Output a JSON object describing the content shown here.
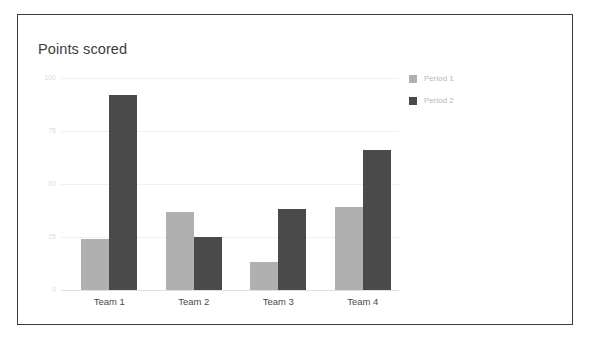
{
  "card": {
    "border_color": "#3a3a3a",
    "background": "#ffffff"
  },
  "title": "Points scored",
  "legend": {
    "position": "right",
    "entries": [
      {
        "label": "Period 1",
        "color": "#b0b0b0",
        "swatch_icon": "square-swatch-icon"
      },
      {
        "label": "Period 2",
        "color": "#4a4a4a",
        "swatch_icon": "square-swatch-icon"
      }
    ]
  },
  "axis": {
    "y_ticks": [
      "0",
      "25",
      "50",
      "75",
      "100"
    ],
    "x_ticks": [
      "Team 1",
      "Team 2",
      "Team 3",
      "Team 4"
    ]
  },
  "chart_data": {
    "type": "bar",
    "title": "Points scored",
    "xlabel": "",
    "ylabel": "",
    "categories": [
      "Team 1",
      "Team 2",
      "Team 3",
      "Team 4"
    ],
    "series": [
      {
        "name": "Period 1",
        "color": "#b0b0b0",
        "values": [
          24,
          37,
          13,
          39
        ]
      },
      {
        "name": "Period 2",
        "color": "#4a4a4a",
        "values": [
          92,
          25,
          38,
          66
        ]
      }
    ],
    "ylim": [
      0,
      100
    ],
    "yticks": [
      0,
      25,
      50,
      75,
      100
    ],
    "grid": true,
    "legend_position": "right",
    "orientation": "vertical",
    "grouping": "grouped"
  }
}
